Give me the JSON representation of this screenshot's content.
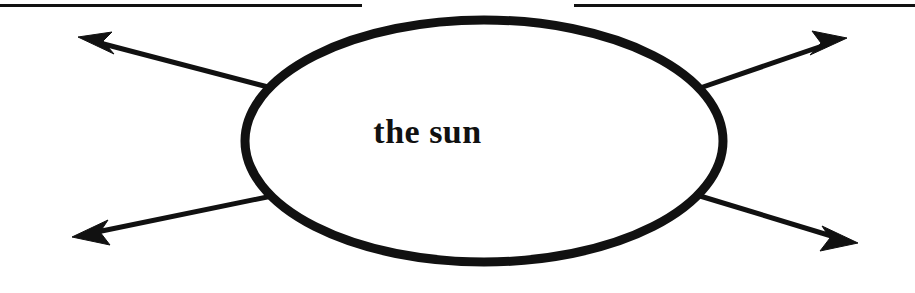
{
  "page": {
    "width": 915,
    "height": 293,
    "background_color": "#ffffff",
    "ink_color": "#111111"
  },
  "rules": [
    {
      "name": "top-rule-left",
      "x": 0,
      "y": 4,
      "width": 362,
      "height": 3
    },
    {
      "name": "top-rule-right",
      "x": 574,
      "y": 4,
      "width": 341,
      "height": 3
    }
  ],
  "diagram": {
    "type": "concept-map",
    "center_node": {
      "shape": "ellipse",
      "label": "the sun",
      "cx": 484,
      "cy": 141,
      "rx": 239,
      "ry": 121,
      "stroke_color": "#111111",
      "stroke_width": 9,
      "fill_color": "#ffffff"
    },
    "branches": [
      {
        "name": "branch-upper-left",
        "label": "",
        "direction": "upper-left",
        "from_x": 272,
        "from_y": 88,
        "to_x": 80,
        "to_y": 38,
        "arrowhead": "end"
      },
      {
        "name": "branch-lower-left",
        "label": "",
        "direction": "lower-left",
        "from_x": 272,
        "from_y": 196,
        "to_x": 74,
        "to_y": 237,
        "arrowhead": "end"
      },
      {
        "name": "branch-upper-right",
        "label": "",
        "direction": "upper-right",
        "from_x": 700,
        "from_y": 88,
        "to_x": 845,
        "to_y": 39,
        "arrowhead": "end"
      },
      {
        "name": "branch-lower-right",
        "label": "",
        "direction": "lower-right",
        "from_x": 700,
        "from_y": 196,
        "to_x": 857,
        "to_y": 243,
        "arrowhead": "end"
      }
    ]
  }
}
